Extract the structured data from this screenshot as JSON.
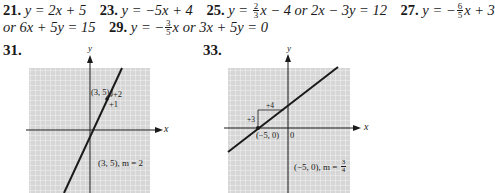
{
  "answers": {
    "a21": {
      "num": "21.",
      "eq": "y = 2x + 5"
    },
    "a23": {
      "num": "23.",
      "eq": "y = −5x + 4"
    },
    "a25": {
      "num": "25.",
      "pre": "y = ",
      "frac_n": "2",
      "frac_d": "3",
      "post": "x − 4 or 2x − 3y = 12"
    },
    "a27": {
      "num": "27.",
      "pre": "y = −",
      "frac_n": "6",
      "frac_d": "5",
      "post": "x + 3"
    },
    "a27b": {
      "text": "or 6x + 5y = 15"
    },
    "a29": {
      "num": "29.",
      "pre": "y = −",
      "frac_n": "3",
      "frac_d": "5",
      "post": "x or 3x + 5y = 0"
    }
  },
  "graphs": [
    {
      "label": "31.",
      "x_axis_label": "x",
      "y_axis_label": "y",
      "point_label": "(3, 5)",
      "rise_label": "+2",
      "run_label": "+1",
      "caption": "(3, 5), m = 2"
    },
    {
      "label": "33.",
      "x_axis_label": "x",
      "y_axis_label": "y",
      "point_label": "(−5, 0)",
      "origin_label": "0",
      "rise_label": "+3",
      "run_label": "+4",
      "caption_pre": "(−5, 0), m = ",
      "caption_frac_n": "3",
      "caption_frac_d": "4"
    }
  ],
  "colors": {
    "grid_bg": "#d9d9d9",
    "grid_line": "#f4f4f4",
    "ink": "#1a1a1a"
  }
}
